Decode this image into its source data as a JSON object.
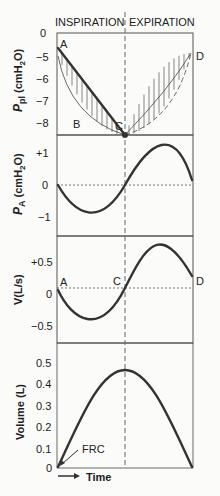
{
  "chart_data": [
    {
      "type": "line",
      "panel": "pleural-pressure",
      "header_left": "INSPIRATION",
      "header_right": "EXPIRATION",
      "ylabel": "P_pl (cmH2O)",
      "ylabel_main": "P",
      "ylabel_sub": "pl",
      "ylabel_unit": " (cmH",
      "ylabel_unit_sub": "2",
      "ylabel_unit_end": "O)",
      "ylim": [
        0,
        -8.4
      ],
      "yticks": [
        "0",
        "−5",
        "−6",
        "−7",
        "−8"
      ],
      "ytick_values": [
        -4.0,
        -5,
        -6,
        -7,
        -8
      ],
      "points": {
        "A": "A",
        "B": "B",
        "C": "C",
        "D": "D"
      },
      "series": [
        {
          "name": "straight line A-C-D",
          "x": [
            0,
            0.5,
            1.0
          ],
          "y": [
            -5.3,
            -8.4,
            -5.3
          ]
        },
        {
          "name": "curve A-B-C",
          "x": [
            0,
            0.1,
            0.2,
            0.3,
            0.4,
            0.5
          ],
          "y": [
            -5.3,
            -6.4,
            -7.2,
            -7.8,
            -8.2,
            -8.4
          ]
        }
      ]
    },
    {
      "type": "line",
      "panel": "alveolar-pressure",
      "ylabel_main": "P",
      "ylabel_sub": "A",
      "ylabel_unit": " (cmH",
      "ylabel_unit_sub": "2",
      "ylabel_unit_end": "O)",
      "ylim": [
        -1.3,
        1.5
      ],
      "yticks": [
        "+1",
        "0",
        "−1"
      ],
      "ytick_values": [
        1,
        0,
        -1
      ],
      "series": [
        {
          "name": "P_A",
          "x": [
            0,
            0.25,
            0.5,
            0.75,
            1.0
          ],
          "y": [
            0,
            -1.0,
            0,
            1.35,
            0.15
          ]
        }
      ]
    },
    {
      "type": "line",
      "panel": "airflow",
      "ylabel": "V̇ (L/s)",
      "ylabel_text": "V(L/s)",
      "ylim": [
        -0.8,
        0.85
      ],
      "yticks": [
        "+0.5",
        "0",
        "−0.5"
      ],
      "ytick_values": [
        0.5,
        0,
        -0.5
      ],
      "points": {
        "A": "A",
        "C": "C",
        "D": "D"
      },
      "series": [
        {
          "name": "airflow",
          "x": [
            0,
            0.25,
            0.5,
            0.75,
            1.0
          ],
          "y": [
            0.1,
            -0.45,
            0.1,
            0.73,
            0.28
          ]
        }
      ]
    },
    {
      "type": "line",
      "panel": "volume",
      "ylabel": "Volume (L)",
      "ylim": [
        0,
        0.58
      ],
      "yticks": [
        "0.5",
        "0.4",
        "0.3",
        "0.2",
        "0.1",
        "0"
      ],
      "ytick_values": [
        0.5,
        0.4,
        0.3,
        0.2,
        0.1,
        0
      ],
      "annotation": "FRC",
      "xlabel": "Time",
      "series": [
        {
          "name": "volume",
          "x": [
            0,
            0.25,
            0.5,
            0.75,
            1.0
          ],
          "y": [
            0,
            0.33,
            0.46,
            0.28,
            0
          ]
        }
      ]
    }
  ]
}
